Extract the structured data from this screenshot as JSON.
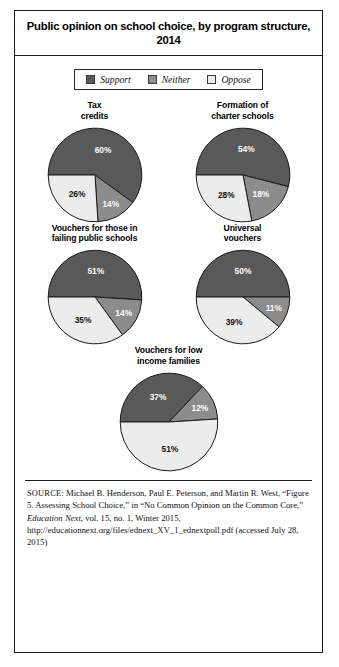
{
  "figure": {
    "title": "Public opinion on school choice, by program structure, 2014"
  },
  "legend": {
    "items": [
      {
        "label": "Support",
        "color": "#595959",
        "key": "support"
      },
      {
        "label": "Neither",
        "color": "#8c8c8c",
        "key": "neither"
      },
      {
        "label": "Oppose",
        "color": "#ececec",
        "key": "oppose"
      }
    ]
  },
  "source": {
    "prefix": "SOURCE:",
    "text_1": " Michael B. Henderson, Paul E. Peterson, and Martin R. West, “Figure 5. Assessing School Choice,” in “No Common Opinion on the Common Core,” ",
    "italic_1": "Education Next",
    "text_2": ", vol. 15, no. 1, Winter 2015, http://educationnext.org/files/ednext_XV_1_ednextpoll.pdf (accessed July 28, 2015)"
  },
  "chart_data": {
    "type": "pie",
    "title": "Public opinion on school choice, by program structure, 2014",
    "legend_position": "top-center",
    "series_names": [
      "Support",
      "Neither",
      "Oppose"
    ],
    "colors": [
      "#595959",
      "#8c8c8c",
      "#ececec"
    ],
    "unit": "percent",
    "charts": [
      {
        "title": "Tax credits",
        "title_lines": [
          "Tax",
          "credits"
        ],
        "categories": [
          "Support",
          "Neither",
          "Oppose"
        ],
        "values": [
          60,
          14,
          26
        ],
        "labels": [
          "60%",
          "14%",
          "26%"
        ]
      },
      {
        "title": "Formation of charter schools",
        "title_lines": [
          "Formation of",
          "charter schools"
        ],
        "categories": [
          "Support",
          "Neither",
          "Oppose"
        ],
        "values": [
          54,
          18,
          28
        ],
        "labels": [
          "54%",
          "18%",
          "28%"
        ]
      },
      {
        "title": "Vouchers for those in failing public schools",
        "title_lines": [
          "Vouchers for those in",
          "failing public schools"
        ],
        "categories": [
          "Support",
          "Neither",
          "Oppose"
        ],
        "values": [
          51,
          14,
          35
        ],
        "labels": [
          "51%",
          "14%",
          "35%"
        ]
      },
      {
        "title": "Universal vouchers",
        "title_lines": [
          "Universal",
          "vouchers"
        ],
        "categories": [
          "Support",
          "Neither",
          "Oppose"
        ],
        "values": [
          50,
          11,
          39
        ],
        "labels": [
          "50%",
          "11%",
          "39%"
        ]
      },
      {
        "title": "Vouchers for low income families",
        "title_lines": [
          "Vouchers for low",
          "income families"
        ],
        "categories": [
          "Support",
          "Neither",
          "Oppose"
        ],
        "values": [
          37,
          12,
          51
        ],
        "labels": [
          "37%",
          "12%",
          "51%"
        ]
      }
    ]
  }
}
